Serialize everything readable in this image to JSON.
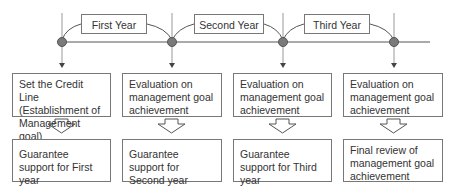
{
  "years": [
    {
      "label": "First Year"
    },
    {
      "label": "Second Year"
    },
    {
      "label": "Third Year"
    }
  ],
  "stages": [
    {
      "top": "Set the Credit Line (Establishment of Management goal)",
      "bottom": "Guarantee support for First year"
    },
    {
      "top": "Evaluation on management goal achievement",
      "bottom": "Guarantee support for Second year"
    },
    {
      "top": "Evaluation on management goal achievement",
      "bottom": "Guarantee support for Third year"
    },
    {
      "top": "Evaluation on management goal achievement",
      "bottom": "Final review of management goal achievement"
    }
  ],
  "colors": {
    "line": "#999999",
    "dot": "#777777",
    "border": "#777777"
  }
}
